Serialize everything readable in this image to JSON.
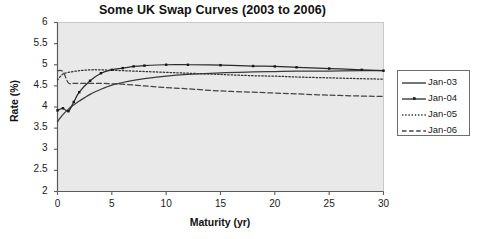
{
  "chart_data": {
    "type": "line",
    "title": "Some UK Swap Curves (2003 to 2006)",
    "xlabel": "Maturity (yr)",
    "ylabel": "Rate (%)",
    "xlim": [
      0,
      30
    ],
    "ylim": [
      2,
      6
    ],
    "xticks": [
      0,
      5,
      10,
      15,
      20,
      25,
      30
    ],
    "yticks": [
      2,
      2.5,
      3,
      3.5,
      4,
      4.5,
      5,
      5.5,
      6
    ],
    "xtick_labels": [
      "0",
      "5",
      "10",
      "15",
      "20",
      "25",
      "30"
    ],
    "ytick_labels": [
      "2",
      "2.5",
      "3",
      "3.5",
      "4",
      "4.5",
      "5",
      "5.5",
      "6"
    ],
    "grid": false,
    "legend_position": "right",
    "plot_background": "#e9e9e9",
    "axis_color": "#5a5a5a",
    "series": [
      {
        "name": "Jan-03",
        "style": "solid",
        "color": "#3a3a3a",
        "markers": false,
        "x": [
          0,
          0.25,
          0.5,
          1,
          1.5,
          2,
          3,
          4,
          5,
          6,
          7,
          8,
          10,
          12,
          15,
          18,
          20,
          22,
          25,
          28,
          30
        ],
        "values": [
          3.65,
          3.74,
          3.82,
          3.95,
          4.05,
          4.14,
          4.3,
          4.42,
          4.52,
          4.58,
          4.63,
          4.67,
          4.73,
          4.77,
          4.81,
          4.83,
          4.84,
          4.85,
          4.85,
          4.86,
          4.86
        ]
      },
      {
        "name": "Jan-04",
        "style": "solid",
        "color": "#2b2b2b",
        "markers": true,
        "x": [
          0,
          0.5,
          1,
          1.5,
          2,
          3,
          4,
          5,
          6,
          7,
          8,
          10,
          12,
          15,
          18,
          20,
          22,
          25,
          28,
          30
        ],
        "values": [
          3.92,
          3.97,
          3.9,
          4.12,
          4.35,
          4.62,
          4.8,
          4.88,
          4.92,
          4.96,
          4.98,
          5.0,
          5.0,
          4.99,
          4.97,
          4.96,
          4.94,
          4.91,
          4.88,
          4.86
        ]
      },
      {
        "name": "Jan-05",
        "style": "dotted",
        "color": "#333333",
        "markers": false,
        "x": [
          0,
          0.5,
          1,
          2,
          3,
          4,
          5,
          6,
          8,
          10,
          12,
          15,
          18,
          20,
          22,
          25,
          28,
          30
        ],
        "values": [
          4.64,
          4.78,
          4.82,
          4.86,
          4.88,
          4.88,
          4.87,
          4.86,
          4.84,
          4.82,
          4.8,
          4.77,
          4.74,
          4.73,
          4.71,
          4.69,
          4.67,
          4.66
        ]
      },
      {
        "name": "Jan-06",
        "style": "dashed",
        "color": "#444444",
        "markers": false,
        "x": [
          0,
          0.5,
          1,
          1.5,
          2,
          3,
          4,
          5,
          6,
          8,
          10,
          12,
          15,
          18,
          20,
          22,
          25,
          28,
          30
        ],
        "values": [
          4.86,
          4.84,
          4.57,
          4.56,
          4.56,
          4.56,
          4.56,
          4.55,
          4.54,
          4.5,
          4.46,
          4.43,
          4.38,
          4.35,
          4.33,
          4.31,
          4.28,
          4.26,
          4.25
        ]
      }
    ]
  },
  "legend": {
    "entries": [
      {
        "label": "Jan-03"
      },
      {
        "label": "Jan-04"
      },
      {
        "label": "Jan-05"
      },
      {
        "label": "Jan-06"
      }
    ]
  }
}
